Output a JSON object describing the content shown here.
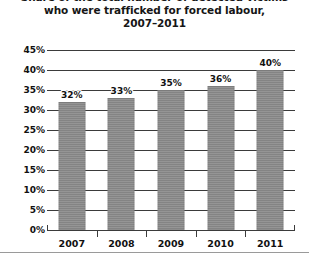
{
  "title": {
    "line1": "Share of the total number of detected victims",
    "line2": "who were trafficked for forced labour,",
    "line3": "2007–2011"
  },
  "colors": {
    "bar": "#8a8a8a",
    "axis": "#3b3b3b",
    "text": "#111111",
    "background": "#ffffff",
    "rule": "#9a9a9a"
  },
  "chart_data": {
    "type": "bar",
    "title": "Share of the total number of detected victims who were trafficked for forced labour, 2007–2011",
    "xlabel": "",
    "ylabel": "",
    "categories": [
      "2007",
      "2008",
      "2009",
      "2010",
      "2011"
    ],
    "values": [
      32,
      33,
      35,
      36,
      40
    ],
    "data_labels": [
      "32%",
      "33%",
      "35%",
      "36%",
      "40%"
    ],
    "ylim": [
      0,
      45
    ],
    "ytick_step": 5,
    "ytick_labels": [
      "45%",
      "40%",
      "35%",
      "30%",
      "25%",
      "20%",
      "15%",
      "10%",
      "5%",
      "0%"
    ],
    "ytick_values": [
      45,
      40,
      35,
      30,
      25,
      20,
      15,
      10,
      5,
      0
    ],
    "grid": true,
    "grid_axis": "y",
    "legend": false,
    "legend_position": "none",
    "value_unit": "percent"
  }
}
